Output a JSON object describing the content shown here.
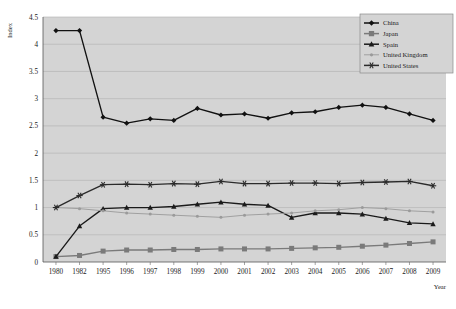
{
  "chart_data": {
    "type": "line",
    "title": "",
    "xlabel": "Year",
    "ylabel": "Index",
    "ylim": [
      0,
      4.5
    ],
    "ytick_step": 0.5,
    "yticks": [
      "0",
      "0.5",
      "1",
      "1.5",
      "2",
      "2.5",
      "3",
      "3.5",
      "4",
      "4.5"
    ],
    "grid": "horizontal",
    "legend_position": "top-right",
    "plot_background": "#d4d4d4",
    "categories": [
      "1980",
      "1982",
      "1995",
      "1996",
      "1997",
      "1998",
      "1999",
      "2000",
      "2001",
      "2002",
      "2003",
      "2004",
      "2005",
      "2006",
      "2007",
      "2008",
      "2009"
    ],
    "series": [
      {
        "name": "China",
        "marker": "diamond",
        "color": "#111111",
        "values": [
          4.25,
          4.25,
          2.66,
          2.55,
          2.63,
          2.6,
          2.82,
          2.7,
          2.72,
          2.64,
          2.74,
          2.76,
          2.84,
          2.88,
          2.84,
          2.72,
          2.6
        ]
      },
      {
        "name": "Japan",
        "marker": "square",
        "color": "#7a7a7a",
        "values": [
          0.1,
          0.12,
          0.2,
          0.22,
          0.22,
          0.23,
          0.23,
          0.24,
          0.24,
          0.24,
          0.25,
          0.26,
          0.27,
          0.29,
          0.31,
          0.34,
          0.37
        ]
      },
      {
        "name": "Spain",
        "marker": "triangle",
        "color": "#1a1a1a",
        "values": [
          0.1,
          0.66,
          0.98,
          1.0,
          1.0,
          1.02,
          1.06,
          1.1,
          1.06,
          1.04,
          0.82,
          0.9,
          0.9,
          0.88,
          0.8,
          0.72,
          0.7
        ]
      },
      {
        "name": "United Kingdom",
        "marker": "dot",
        "color": "#9a9a9a",
        "values": [
          1.0,
          0.98,
          0.94,
          0.9,
          0.88,
          0.86,
          0.84,
          0.82,
          0.86,
          0.88,
          0.9,
          0.94,
          0.96,
          1.0,
          0.98,
          0.94,
          0.92
        ]
      },
      {
        "name": "United States",
        "marker": "asterisk",
        "color": "#2b2b2b",
        "values": [
          1.0,
          1.22,
          1.42,
          1.43,
          1.42,
          1.44,
          1.43,
          1.48,
          1.44,
          1.44,
          1.45,
          1.45,
          1.44,
          1.46,
          1.47,
          1.48,
          1.4
        ]
      }
    ]
  },
  "legend": {
    "items": [
      {
        "label": "China"
      },
      {
        "label": "Japan"
      },
      {
        "label": "Spain"
      },
      {
        "label": "United Kingdom"
      },
      {
        "label": "United States"
      }
    ]
  }
}
